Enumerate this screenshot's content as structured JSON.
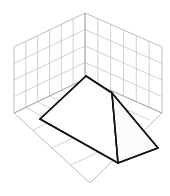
{
  "figure": {
    "title": "",
    "kind": "3d-polyhedron-in-grid-box",
    "canvas": {
      "width": 170,
      "height": 196,
      "background": "#ffffff"
    },
    "colors": {
      "grid_line": "#b4b4b4",
      "grid_frame": "#a0a0a0",
      "solid_edge": "#141414",
      "face_light": "#ffffff",
      "face_mid": "#fbfbfb",
      "face_dark": "#f4f4f4"
    },
    "grid": {
      "divisions_u": 6,
      "divisions_v": 4,
      "divisions_floor_u": 6,
      "divisions_floor_v": 4,
      "left_wall": {
        "corner_top_back": [
          85,
          13
        ],
        "corner_top_front": [
          14,
          47
        ],
        "corner_bottom_front": [
          14,
          113
        ],
        "corner_bottom_back": [
          85,
          79
        ]
      },
      "right_wall": {
        "corner_top_back": [
          85,
          13
        ],
        "corner_top_front": [
          162,
          47
        ],
        "corner_bottom_front": [
          162,
          113
        ],
        "corner_bottom_back": [
          85,
          79
        ]
      },
      "floor": {
        "corner_back": [
          85,
          79
        ],
        "corner_left": [
          14,
          113
        ],
        "corner_front": [
          90,
          183
        ],
        "corner_right": [
          162,
          113
        ]
      }
    },
    "solid": {
      "name": "ridged-pyramid",
      "apex_ridge_back": [
        86,
        76
      ],
      "apex_ridge_front": [
        112,
        93
      ],
      "base_left": [
        40,
        119
      ],
      "base_front": [
        118,
        163
      ],
      "base_right": [
        158,
        148
      ],
      "base_back_hidden": [
        80,
        104
      ],
      "vertices": [
        {
          "label": "apex-back",
          "x": 86,
          "y": 76
        },
        {
          "label": "ridge-front",
          "x": 112,
          "y": 93
        },
        {
          "label": "base-left",
          "x": 40,
          "y": 119
        },
        {
          "label": "base-front",
          "x": 118,
          "y": 163
        },
        {
          "label": "base-right",
          "x": 158,
          "y": 148
        }
      ],
      "faces": [
        {
          "label": "face-left-large",
          "points": "86,76 112,93 118,163 40,119",
          "shade": "#ffffff"
        },
        {
          "label": "face-right",
          "points": "112,93 158,148 118,163",
          "shade": "#fbfbfb"
        }
      ],
      "edges": [
        {
          "label": "edge-ridge",
          "from": [
            86,
            76
          ],
          "to": [
            112,
            93
          ]
        },
        {
          "label": "edge-apex-to-base-left",
          "from": [
            86,
            76
          ],
          "to": [
            40,
            119
          ]
        },
        {
          "label": "edge-base-left-to-front",
          "from": [
            40,
            119
          ],
          "to": [
            118,
            163
          ]
        },
        {
          "label": "edge-ridge-front-to-base-front",
          "from": [
            112,
            93
          ],
          "to": [
            118,
            163
          ]
        },
        {
          "label": "edge-ridge-front-to-base-right",
          "from": [
            112,
            93
          ],
          "to": [
            158,
            148
          ]
        },
        {
          "label": "edge-base-front-to-base-right",
          "from": [
            118,
            163
          ],
          "to": [
            158,
            148
          ]
        }
      ]
    },
    "axes": {
      "tick_labels_visible": false,
      "axis_labels_visible": false,
      "legend_visible": false
    }
  },
  "chart_data": {
    "type": "scatter",
    "title": "",
    "xlabel": "",
    "ylabel": ""
  }
}
